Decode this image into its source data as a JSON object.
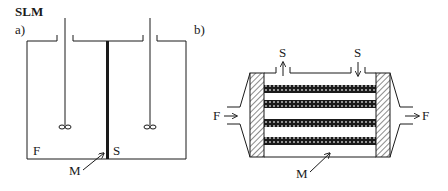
{
  "title": "SLM",
  "panels": [
    {
      "id": "a",
      "label": "a)",
      "description": "Stirred two-compartment cell separated by membrane",
      "compartments": {
        "left": "F",
        "right": "S"
      },
      "membrane_label": "M"
    },
    {
      "id": "b",
      "label": "b)",
      "description": "Hollow/flat-sheet module with feed through channels and stripping on shell side",
      "feed_in": "F",
      "feed_out": "F",
      "strip_out": "S",
      "strip_in": "S",
      "membrane_label": "M"
    }
  ],
  "colors": {
    "line": "#1a1a1a",
    "background": "#ffffff"
  }
}
